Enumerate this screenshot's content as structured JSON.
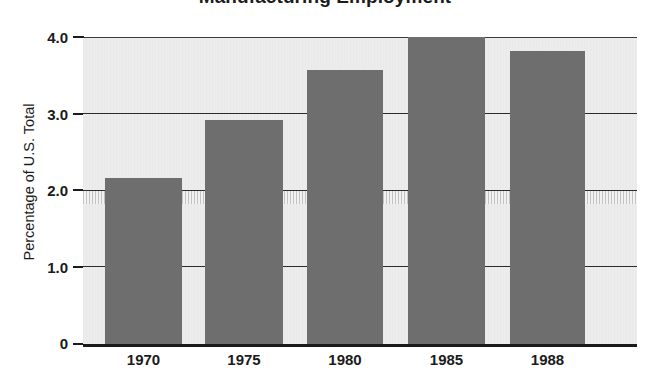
{
  "chart_data": {
    "type": "bar",
    "title": "Manufacturing Employment",
    "subtitle": "",
    "xlabel": "",
    "ylabel": "Percentage of U.S. Total",
    "categories": [
      "1970",
      "1975",
      "1980",
      "1985",
      "1988"
    ],
    "values": [
      2.16,
      2.92,
      3.57,
      4.0,
      3.82
    ],
    "series": [
      {
        "name": "Percentage of U.S. Total",
        "values": [
          2.16,
          2.92,
          3.57,
          4.0,
          3.82
        ]
      }
    ],
    "ylim": [
      0,
      4.0
    ],
    "ytick_labels": [
      "4.0",
      "3.0",
      "2.0",
      "1.0",
      "0"
    ],
    "ytick_values": [
      4.0,
      3.0,
      2.0,
      1.0,
      0
    ],
    "grid": true,
    "grid_axis": "y",
    "legend": false,
    "legend_position": "none",
    "annotations": [],
    "colors": {
      "bar": "#6e6e6e",
      "plot_background": "#ececec",
      "page_background": "#ffffff",
      "gridline": "#2b2b2b",
      "axis": "#1b1b1b",
      "text": "#1b1b1b"
    }
  }
}
